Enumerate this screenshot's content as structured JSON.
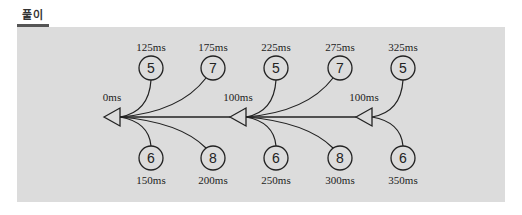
{
  "title": "풀이",
  "colors": {
    "panel_background": "#dcdcdc",
    "line": "#222222",
    "title_bar": "#555555"
  },
  "junctions": [
    {
      "id": "j0",
      "label": "0ms",
      "tip_x": 104,
      "y": 117
    },
    {
      "id": "j1",
      "label": "100ms",
      "tip_x": 230,
      "y": 117
    },
    {
      "id": "j2",
      "label": "100ms",
      "tip_x": 356,
      "y": 117
    }
  ],
  "top_nodes": [
    {
      "value": "5",
      "time": "125ms",
      "x": 151,
      "junction": 0
    },
    {
      "value": "7",
      "time": "175ms",
      "x": 213,
      "junction": 0
    },
    {
      "value": "5",
      "time": "225ms",
      "x": 276,
      "junction": 1
    },
    {
      "value": "7",
      "time": "275ms",
      "x": 340,
      "junction": 1
    },
    {
      "value": "5",
      "time": "325ms",
      "x": 403,
      "junction": 2
    }
  ],
  "bottom_nodes": [
    {
      "value": "6",
      "time": "150ms",
      "x": 151,
      "junction": 0
    },
    {
      "value": "8",
      "time": "200ms",
      "x": 213,
      "junction": 0
    },
    {
      "value": "6",
      "time": "250ms",
      "x": 276,
      "junction": 1
    },
    {
      "value": "8",
      "time": "300ms",
      "x": 340,
      "junction": 1
    },
    {
      "value": "6",
      "time": "350ms",
      "x": 403,
      "junction": 2
    }
  ]
}
